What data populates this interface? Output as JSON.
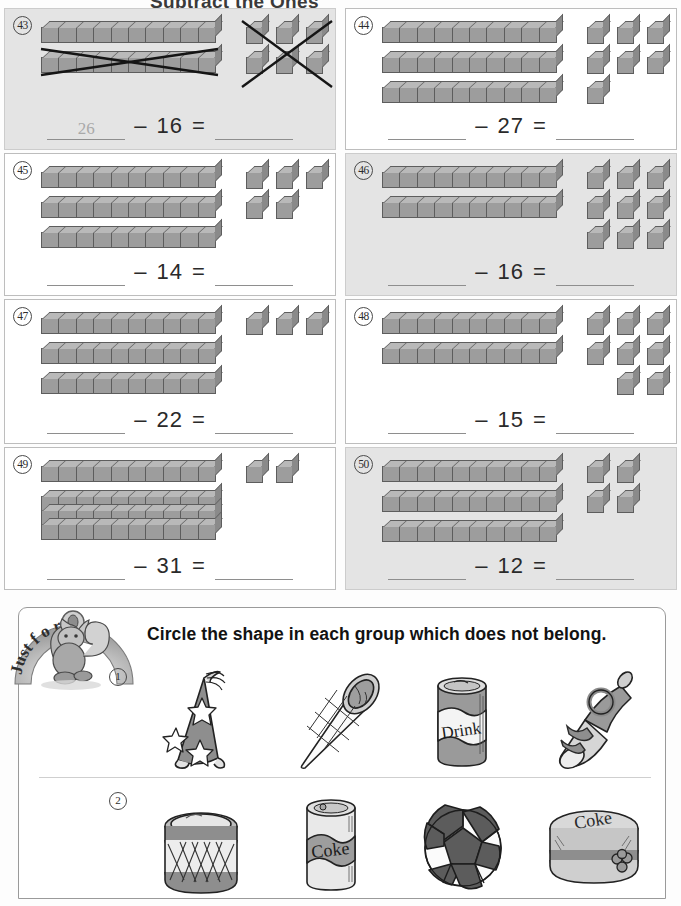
{
  "page": {
    "header_partial": "Subtract the Ones",
    "paper_bg": "#fdfdfd",
    "block_fill": "#9d9d9d",
    "tint_bg": "#e4e4e4"
  },
  "problems": [
    {
      "number": "43",
      "tinted": true,
      "rods": 2,
      "cubes": 6,
      "cube_layout": [
        3,
        3
      ],
      "crossed_out": true,
      "crossed_rods": 1,
      "crossed_cubes": 6,
      "answer_first": "26",
      "minus_label": "–",
      "subtrahend": "16",
      "equals_label": "=",
      "answer_last": ""
    },
    {
      "number": "44",
      "tinted": false,
      "rods": 3,
      "cubes": 7,
      "cube_layout": [
        3,
        3,
        1
      ],
      "crossed_out": false,
      "answer_first": "",
      "minus_label": "–",
      "subtrahend": "27",
      "equals_label": "=",
      "answer_last": ""
    },
    {
      "number": "45",
      "tinted": false,
      "rods": 3,
      "cubes": 5,
      "cube_layout": [
        3,
        2
      ],
      "crossed_out": false,
      "answer_first": "",
      "minus_label": "–",
      "subtrahend": "14",
      "equals_label": "=",
      "answer_last": ""
    },
    {
      "number": "46",
      "tinted": true,
      "rods": 2,
      "cubes": 9,
      "cube_layout": [
        3,
        3,
        3
      ],
      "crossed_out": false,
      "answer_first": "",
      "minus_label": "–",
      "subtrahend": "16",
      "equals_label": "=",
      "answer_last": ""
    },
    {
      "number": "47",
      "tinted": false,
      "rods": 3,
      "cubes": 3,
      "cube_layout": [
        3
      ],
      "crossed_out": false,
      "answer_first": "",
      "minus_label": "–",
      "subtrahend": "22",
      "equals_label": "=",
      "answer_last": ""
    },
    {
      "number": "48",
      "tinted": false,
      "rods": 2,
      "cubes": 8,
      "cube_layout": [
        3,
        3,
        2
      ],
      "crossed_out": false,
      "answer_first": "",
      "minus_label": "–",
      "subtrahend": "15",
      "equals_label": "=",
      "answer_last": ""
    },
    {
      "number": "49",
      "tinted": false,
      "rods": 1,
      "stacked_rods": 3,
      "cubes": 2,
      "cube_layout": [
        2
      ],
      "crossed_out": false,
      "answer_first": "",
      "minus_label": "–",
      "subtrahend": "31",
      "equals_label": "=",
      "answer_last": ""
    },
    {
      "number": "50",
      "tinted": true,
      "rods": 3,
      "cubes": 4,
      "cube_layout": [
        2,
        2
      ],
      "crossed_out": false,
      "answer_first": "",
      "minus_label": "–",
      "subtrahend": "12",
      "equals_label": "=",
      "answer_last": ""
    }
  ],
  "fun_section": {
    "badge_text": "Just for Fun",
    "badge_letters": [
      "J",
      "u",
      "s",
      "t",
      "f",
      "o",
      "r",
      "F",
      "u",
      "n"
    ],
    "mascot": "squirrel-mascot",
    "instruction": "Circle the shape in each group which does not belong.",
    "groups": [
      {
        "number": "1",
        "items": [
          {
            "name": "party-hat",
            "label": ""
          },
          {
            "name": "ice-cream-cone",
            "label": ""
          },
          {
            "name": "drink-can",
            "label": "Drink"
          },
          {
            "name": "party-horn",
            "label": ""
          }
        ]
      },
      {
        "number": "2",
        "items": [
          {
            "name": "drum",
            "label": ""
          },
          {
            "name": "coke-can",
            "label": "Coke"
          },
          {
            "name": "soccer-ball",
            "label": ""
          },
          {
            "name": "coke-hat-box",
            "label": "Coke"
          }
        ]
      }
    ]
  }
}
